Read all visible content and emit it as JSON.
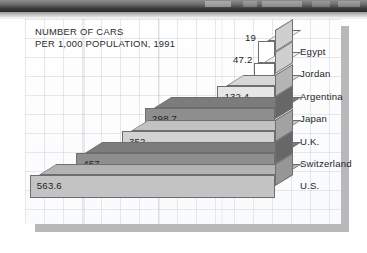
{
  "chart_data": {
    "type": "bar",
    "orientation": "horizontal",
    "title_lines": [
      "NUMBER OF CARS",
      "PER 1,000 POPULATION, 1991"
    ],
    "xlabel": "",
    "ylabel": "",
    "categories": [
      "Egypt",
      "Jordan",
      "Argentina",
      "Japan",
      "U.K.",
      "Switzerland",
      "U.S."
    ],
    "values": [
      19,
      47.2,
      132.4,
      298.7,
      352,
      457,
      563.6
    ],
    "value_labels": [
      "19",
      "47.2",
      "132.4",
      "298.7",
      "352",
      "457",
      "563.6"
    ],
    "xlim": [
      0,
      640
    ],
    "grid": true,
    "legend": null,
    "style": "3d-stacked-horizontal-bars",
    "bar_colors": [
      "#ffffff",
      "#ffffff",
      "#e6e6e6",
      "#8e8e8e",
      "#d2d2d2",
      "#8e8e8e",
      "#c3c3c3"
    ],
    "bar_top_colors": [
      "#f0f0f0",
      "#f0f0f0",
      "#d7d7d7",
      "#7c7c7c",
      "#c2c2c2",
      "#7c7c7c",
      "#b3b3b3"
    ],
    "bar_side_colors": [
      "#cfcfcf",
      "#cfcfcf",
      "#b4b4b4",
      "#676767",
      "#a2a2a2",
      "#676767",
      "#969696"
    ],
    "units": "cars per 1,000 population",
    "year": 1991
  },
  "page": {
    "card_background": "#ffffff",
    "grid_color": "#96a5be",
    "shadow_color": "#b9b9bb",
    "text_color": "#1f1f1f"
  },
  "title": {
    "line1": "NUMBER OF CARS",
    "line2": "PER 1,000 POPULATION, 1991"
  },
  "bars": [
    {
      "country": "Egypt",
      "value_label": "19",
      "value": 19
    },
    {
      "country": "Jordan",
      "value_label": "47.2",
      "value": 47.2
    },
    {
      "country": "Argentina",
      "value_label": "132.4",
      "value": 132.4
    },
    {
      "country": "Japan",
      "value_label": "298.7",
      "value": 298.7
    },
    {
      "country": "U.K.",
      "value_label": "352",
      "value": 352
    },
    {
      "country": "Switzerland",
      "value_label": "457",
      "value": 457
    },
    {
      "country": "U.S.",
      "value_label": "563.6",
      "value": 563.6
    }
  ]
}
